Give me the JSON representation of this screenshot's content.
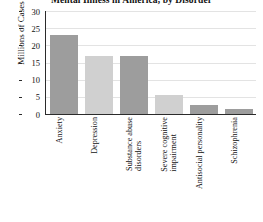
{
  "chart_data": {
    "type": "bar",
    "title": "Mental Illness in America, by Disorder",
    "xlabel": "",
    "ylabel": "Millions of Cases",
    "categories": [
      "Anxiety",
      "Depression",
      "Substance abuse disorders",
      "Severe cognitive impairment",
      "Antisocial personality",
      "Schizophrenia"
    ],
    "category_lines": [
      [
        "Anxiety"
      ],
      [
        "Depression"
      ],
      [
        "Substance abuse",
        "disorders"
      ],
      [
        "Severe cognitive",
        "impairment"
      ],
      [
        "Antisocial personality"
      ],
      [
        "Schizophrenia"
      ]
    ],
    "values": [
      23,
      17,
      17,
      5.5,
      2.5,
      1.5
    ],
    "bar_colors": [
      "#9d9d9d",
      "#d0d0d0",
      "#9d9d9d",
      "#d0d0d0",
      "#9d9d9d",
      "#9d9d9d"
    ],
    "ylim": [
      0,
      30
    ],
    "yticks": [
      0,
      5,
      10,
      15,
      20,
      25,
      30
    ],
    "ytick_labels": [
      "0",
      "5",
      "10",
      "15",
      "20",
      "25",
      "30"
    ],
    "grid": true,
    "legend": null
  }
}
